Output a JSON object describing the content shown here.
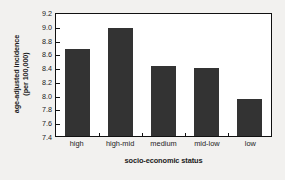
{
  "chart_data": {
    "type": "bar",
    "title": "",
    "categories": [
      "high",
      "high-mid",
      "medium",
      "mid-low",
      "low"
    ],
    "values": [
      8.69,
      8.99,
      8.43,
      8.41,
      7.95
    ],
    "xlabel": "socio-economic status",
    "ylabel_line1": "age-adjusted incidence",
    "ylabel_line2": "(per 100,000)",
    "ylim": [
      7.4,
      9.2
    ],
    "ytick_values": [
      7.4,
      7.6,
      7.8,
      8.0,
      8.2,
      8.4,
      8.6,
      8.8,
      9.0,
      9.2
    ],
    "ytick_labels": [
      "7.4",
      "7.6",
      "7.8",
      "8.0",
      "8.2",
      "8.4",
      "8.6",
      "8.8",
      "9.0",
      "9.2"
    ],
    "grid": false,
    "legend": null,
    "bar_color": "#333333",
    "plot_background": "#ffffff",
    "figure_background": "#f2f1ef",
    "axis_color": "#111111"
  }
}
